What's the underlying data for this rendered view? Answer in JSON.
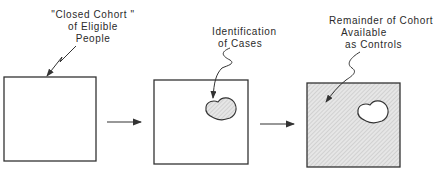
{
  "diagram": {
    "stages": [
      {
        "id": "closed-cohort",
        "label_lines": [
          "\"Closed Cohort \"",
          "of Eligible",
          "People"
        ],
        "box_fill": "none"
      },
      {
        "id": "identification-of-cases",
        "label_lines": [
          "Identification",
          "of Cases"
        ],
        "box_fill": "none",
        "region": "cases (shaded)"
      },
      {
        "id": "remainder-controls",
        "label_lines": [
          "Remainder of Cohort",
          "Available",
          "as Controls"
        ],
        "box_fill": "hatched",
        "region": "cases (unshaded)"
      }
    ],
    "flow": [
      "closed-cohort",
      "identification-of-cases",
      "remainder-controls"
    ],
    "colors": {
      "stroke": "#333333",
      "shade": "#d8d8d8",
      "background": "#ffffff"
    }
  }
}
